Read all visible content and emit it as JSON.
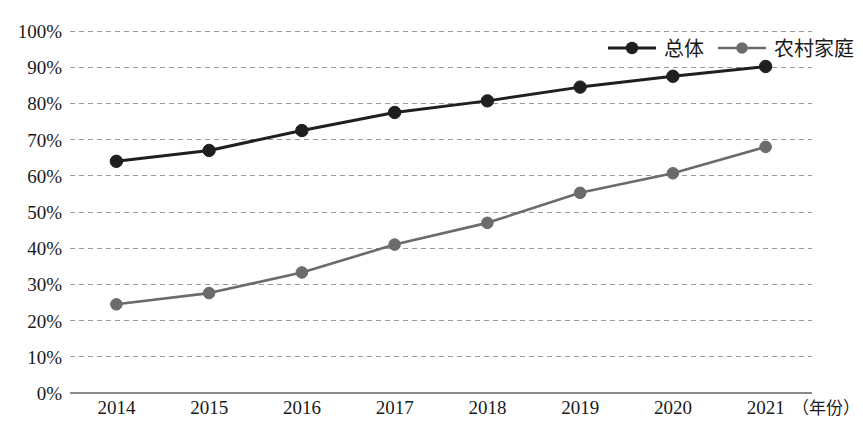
{
  "chart_data": {
    "type": "line",
    "title": "",
    "subtitle": "",
    "xlabel": "年份",
    "xlabel_display": "（年份）",
    "ylabel": "",
    "categories": [
      "2014",
      "2015",
      "2016",
      "2017",
      "2018",
      "2019",
      "2020",
      "2021"
    ],
    "x": [
      2014,
      2015,
      2016,
      2017,
      2018,
      2019,
      2020,
      2021
    ],
    "series": [
      {
        "name": "总体",
        "color": "#1f1f1f",
        "marker": "circle",
        "values": [
          64,
          67,
          72.5,
          77.5,
          80.7,
          84.5,
          87.5,
          90.2
        ]
      },
      {
        "name": "农村家庭",
        "color": "#6b6b6b",
        "marker": "circle",
        "values": [
          24.5,
          27.6,
          33.3,
          41,
          47,
          55.3,
          60.7,
          68
        ]
      }
    ],
    "ylim": [
      0,
      100
    ],
    "ytick_labels": [
      "0%",
      "10%",
      "20%",
      "30%",
      "40%",
      "50%",
      "60%",
      "70%",
      "80%",
      "90%",
      "100%"
    ],
    "ytick_values": [
      0,
      10,
      20,
      30,
      40,
      50,
      60,
      70,
      80,
      90,
      100
    ],
    "grid": true,
    "grid_style": "dashed-horizontal",
    "legend_position": "top-right",
    "legend_entries": [
      "总体",
      "农村家庭"
    ],
    "axis_colors": {
      "grid": "#9a9a9a",
      "axis": "#8a8a8a",
      "text": "#1a1a1a"
    }
  }
}
